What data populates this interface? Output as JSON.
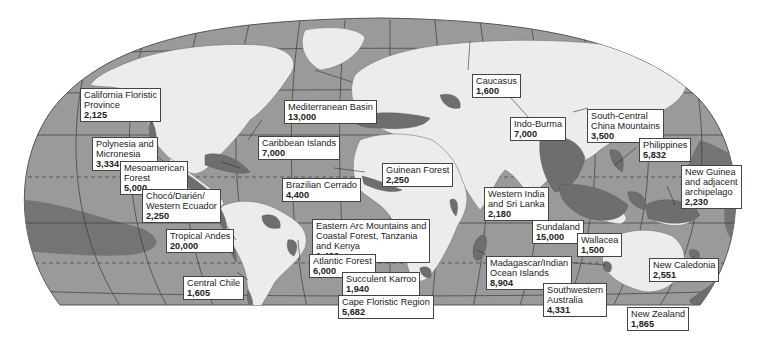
{
  "map": {
    "type": "world map of biodiversity hotspots",
    "colors": {
      "ocean": "#9a9a9a",
      "land": "#ececec",
      "hotspot": "#6e6e6e",
      "hotspot_marine": "#7c7c7c",
      "graticule": "#3c3c3c",
      "border": "#8a8a8a",
      "label_bg": "#ffffff",
      "label_border": "#444444"
    }
  },
  "hotspots": [
    {
      "name": "California Floristic\nProvince",
      "count": "2,125"
    },
    {
      "name": "Polynesia and\nMicronesia",
      "count": "3,334"
    },
    {
      "name": "Mesoamerican\nForest",
      "count": "5,000"
    },
    {
      "name": "Chocó/Darién/\nWestern Ecuador",
      "count": "2,250"
    },
    {
      "name": "Tropical Andes",
      "count": "20,000"
    },
    {
      "name": "Central Chile",
      "count": "1,605"
    },
    {
      "name": "Caribbean Islands",
      "count": "7,000"
    },
    {
      "name": "Mediterranean Basin",
      "count": "13,000"
    },
    {
      "name": "Brazilian Cerrado",
      "count": "4,400"
    },
    {
      "name": "Guinean Forest",
      "count": "2,250"
    },
    {
      "name": "Eastern Arc Mountains and\nCoastal Forest, Tanzania\nand Kenya",
      "count": "1,400"
    },
    {
      "name": "Atlantic Forest",
      "count": "6,000"
    },
    {
      "name": "Succulent Karroo",
      "count": "1,940"
    },
    {
      "name": "Cape Floristic Region",
      "count": "5,682"
    },
    {
      "name": "Caucasus",
      "count": "1,600"
    },
    {
      "name": "Indo-Burma",
      "count": "7,000"
    },
    {
      "name": "South-Central\nChina Mountains",
      "count": "3,500"
    },
    {
      "name": "Philippines",
      "count": "5,832"
    },
    {
      "name": "New Guinea\nand adjacent\narchipelago",
      "count": "2,230"
    },
    {
      "name": "Western India\nand Sri Lanka",
      "count": "2,180"
    },
    {
      "name": "Sundaland",
      "count": "15,000"
    },
    {
      "name": "Wallacea",
      "count": "1,500"
    },
    {
      "name": "Madagascar/Indian\nOcean Islands",
      "count": "8,904"
    },
    {
      "name": "Southwestern\nAustralia",
      "count": "4,331"
    },
    {
      "name": "New Caledonia",
      "count": "2,551"
    },
    {
      "name": "New Zealand",
      "count": "1,865"
    }
  ]
}
